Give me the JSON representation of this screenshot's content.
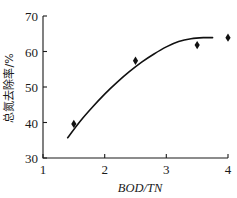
{
  "chart_data": {
    "type": "scatter",
    "title": "",
    "xlabel": "BOD/TN",
    "ylabel": "总氮去除率/%",
    "xlim": [
      1,
      4
    ],
    "ylim": [
      30,
      70
    ],
    "xticks": [
      "1",
      "2",
      "3",
      "4"
    ],
    "xtick_values": [
      1,
      2,
      3,
      4
    ],
    "yticks": [
      "30",
      "40",
      "50",
      "60",
      "70"
    ],
    "ytick_values": [
      30,
      40,
      50,
      60,
      70
    ],
    "grid": false,
    "legend": null,
    "series": [
      {
        "name": "总氮去除率",
        "marker": "diamond",
        "color": "#111111",
        "x": [
          1.5,
          2.5,
          3.5,
          4.0
        ],
        "values": [
          39.6,
          57.4,
          61.8,
          63.9
        ]
      },
      {
        "name": "拟合曲线",
        "marker": "none",
        "color": "#111111",
        "x": [
          1.4,
          1.6,
          1.8,
          2.0,
          2.2,
          2.4,
          2.6,
          2.8,
          3.0,
          3.2,
          3.4,
          3.6,
          3.75
        ],
        "values": [
          35.7,
          40.3,
          44.3,
          48.0,
          51.3,
          54.3,
          57.0,
          59.3,
          61.3,
          62.8,
          63.6,
          63.9,
          63.9
        ]
      }
    ]
  },
  "axis": {
    "x_title": "BOD/TN",
    "y_title": "总氮去除率/%"
  }
}
